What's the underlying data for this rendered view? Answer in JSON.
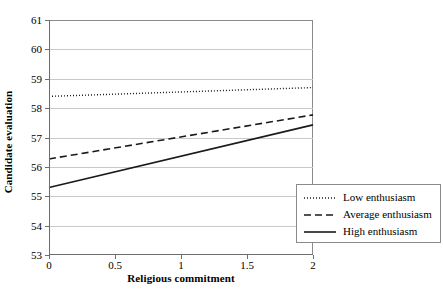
{
  "chart_data": {
    "type": "line",
    "title": "",
    "xlabel": "Religious commitment",
    "ylabel": "Candidate evaluation",
    "xlim": [
      0,
      2
    ],
    "ylim": [
      53,
      61
    ],
    "xticks": [
      "0",
      "0.5",
      "1",
      "1.5",
      "2"
    ],
    "xtick_values": [
      0,
      0.5,
      1,
      1.5,
      2
    ],
    "yticks": [
      "53",
      "54",
      "55",
      "56",
      "57",
      "58",
      "59",
      "60",
      "61"
    ],
    "ytick_values": [
      53,
      54,
      55,
      56,
      57,
      58,
      59,
      60,
      61
    ],
    "grid": "horizontal",
    "legend_position": "bottom-right-outside",
    "x": [
      0,
      2
    ],
    "series": [
      {
        "name": "Low enthusiasm",
        "style": "dotted",
        "values": [
          58.4,
          58.7
        ]
      },
      {
        "name": "Average enthusiasm",
        "style": "dashed",
        "values": [
          56.27,
          57.77
        ]
      },
      {
        "name": "High enthusiasm",
        "style": "solid",
        "values": [
          55.3,
          57.43
        ]
      }
    ]
  },
  "legend": {
    "items": [
      {
        "label": "Low enthusiasm"
      },
      {
        "label": "Average enthusiasm"
      },
      {
        "label": "High enthusiasm"
      }
    ]
  }
}
